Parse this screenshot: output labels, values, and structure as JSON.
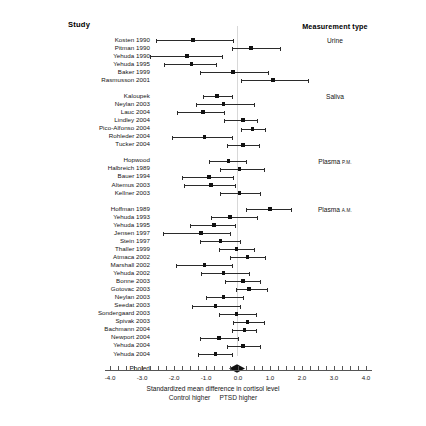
{
  "header": {
    "study_column": "Study",
    "measurement_column": "Measurement type"
  },
  "axis": {
    "title": "Standardized mean difference in cortisol level",
    "left_direction": "Control higher",
    "right_direction": "PTSD higher",
    "ticks": [
      "-4.0",
      "-3.0",
      "-2.0",
      "-1.0",
      "0.0",
      "1.0",
      "2.0",
      "3.0",
      "4.0"
    ],
    "min": -4.0,
    "max": 4.0,
    "minor_tick_step": 0.25
  },
  "pooled": {
    "label": "Pooled",
    "estimate": -0.03,
    "ci_low": -0.28,
    "ci_high": 0.22
  },
  "chart_data": {
    "type": "forest",
    "title": "",
    "xlabel": "Standardized mean difference in cortisol level",
    "ylabel": "Study",
    "xlim": [
      -4.0,
      4.0
    ],
    "grid": false,
    "legend": "none",
    "zero_reference": 0.0,
    "groups": [
      {
        "name": "Urine",
        "studies": [
          {
            "label": "Kosten 1990",
            "estimate": -1.4,
            "ci_low": -2.55,
            "ci_high": -0.15
          },
          {
            "label": "Pitman 1990",
            "estimate": 0.4,
            "ci_low": -0.2,
            "ci_high": 1.3
          },
          {
            "label": "Yehuda 1990",
            "estimate": -1.6,
            "ci_low": -2.75,
            "ci_high": -0.5
          },
          {
            "label": "Yehuda 1995",
            "estimate": -1.45,
            "ci_low": -2.3,
            "ci_high": -0.7
          },
          {
            "label": "Baker 1999",
            "estimate": -0.15,
            "ci_low": -1.2,
            "ci_high": 0.95
          },
          {
            "label": "Rasmusson 2001",
            "estimate": 1.1,
            "ci_low": 0.1,
            "ci_high": 2.2
          }
        ]
      },
      {
        "name": "Saliva",
        "studies": [
          {
            "label": "Kaloupek",
            "estimate": -0.65,
            "ci_low": -1.1,
            "ci_high": -0.2
          },
          {
            "label": "Neylan 2003",
            "estimate": -0.45,
            "ci_low": -1.3,
            "ci_high": 0.5
          },
          {
            "label": "Lauc 2004",
            "estimate": -1.1,
            "ci_low": -1.9,
            "ci_high": -0.45
          },
          {
            "label": "Lindley 2004",
            "estimate": 0.15,
            "ci_low": -0.45,
            "ci_high": 0.6
          },
          {
            "label": "Pico-Alfonso 2004",
            "estimate": 0.45,
            "ci_low": 0.1,
            "ci_high": 0.85
          },
          {
            "label": "Rohleder 2004",
            "estimate": -1.05,
            "ci_low": -2.05,
            "ci_high": -0.2
          },
          {
            "label": "Tucker 2004",
            "estimate": 0.15,
            "ci_low": -0.35,
            "ci_high": 0.65
          }
        ]
      },
      {
        "name": "Plasma P.M.",
        "studies": [
          {
            "label": "Hopwood",
            "estimate": -0.3,
            "ci_low": -0.9,
            "ci_high": 0.25
          },
          {
            "label": "Halbreich 1989",
            "estimate": 0.05,
            "ci_low": -0.55,
            "ci_high": 0.8
          },
          {
            "label": "Bauer 1994",
            "estimate": -0.9,
            "ci_low": -1.75,
            "ci_high": -0.15
          },
          {
            "label": "Altemus 2003",
            "estimate": -0.85,
            "ci_low": -1.7,
            "ci_high": -0.1
          },
          {
            "label": "Kellner 2003",
            "estimate": 0.05,
            "ci_low": -0.55,
            "ci_high": 0.7
          }
        ]
      },
      {
        "name": "Plasma A.M.",
        "studies": [
          {
            "label": "Hoffman 1989",
            "estimate": 1.0,
            "ci_low": 0.25,
            "ci_high": 1.65
          },
          {
            "label": "Yehuda 1993",
            "estimate": -0.25,
            "ci_low": -0.85,
            "ci_high": 0.6
          },
          {
            "label": "Yehuda 1995",
            "estimate": -0.75,
            "ci_low": -1.5,
            "ci_high": -0.1
          },
          {
            "label": "Jensen 1997",
            "estimate": -1.15,
            "ci_low": -2.35,
            "ci_high": -0.25
          },
          {
            "label": "Stein 1997",
            "estimate": -0.55,
            "ci_low": -1.2,
            "ci_high": 0.05
          },
          {
            "label": "Thaller 1999",
            "estimate": -0.05,
            "ci_low": -0.6,
            "ci_high": 0.5
          },
          {
            "label": "Atmaca 2002",
            "estimate": 0.3,
            "ci_low": -0.25,
            "ci_high": 0.85
          },
          {
            "label": "Marshall 2002",
            "estimate": -1.05,
            "ci_low": -1.95,
            "ci_high": -0.2
          },
          {
            "label": "Yehuda 2002",
            "estimate": -0.45,
            "ci_low": -1.15,
            "ci_high": 0.35
          },
          {
            "label": "Bonne 2003",
            "estimate": 0.15,
            "ci_low": -0.4,
            "ci_high": 0.7
          },
          {
            "label": "Gotovac 2003",
            "estimate": 0.35,
            "ci_low": -0.05,
            "ci_high": 0.9
          },
          {
            "label": "Neylan 2003",
            "estimate": -0.45,
            "ci_low": -1.0,
            "ci_high": 0.15
          },
          {
            "label": "Seedat 2003",
            "estimate": -0.7,
            "ci_low": -1.45,
            "ci_high": 0.05
          },
          {
            "label": "Sondergaard 2003",
            "estimate": -0.05,
            "ci_low": -0.6,
            "ci_high": 0.55
          },
          {
            "label": "Spivak 2003",
            "estimate": 0.3,
            "ci_low": -0.15,
            "ci_high": 0.8
          },
          {
            "label": "Bachmann 2004",
            "estimate": 0.2,
            "ci_low": -0.2,
            "ci_high": 0.55
          },
          {
            "label": "Newport 2004",
            "estimate": -0.6,
            "ci_low": -1.2,
            "ci_high": 0.0
          },
          {
            "label": "Yehuda 2004",
            "estimate": 0.15,
            "ci_low": -0.35,
            "ci_high": 0.7
          },
          {
            "label": "Yehuda 2004",
            "estimate": -0.7,
            "ci_low": -1.25,
            "ci_high": -0.2
          }
        ]
      }
    ],
    "pooled": {
      "label": "Pooled",
      "estimate": -0.03,
      "ci_low": -0.28,
      "ci_high": 0.22
    }
  }
}
